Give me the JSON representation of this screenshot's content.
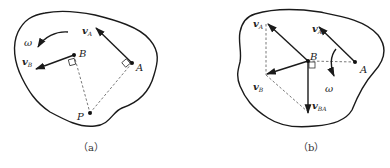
{
  "figure_a": {
    "caption": "（a）",
    "labels": {
      "vA": "v",
      "vA_sub": "A",
      "vB": "v",
      "vB_sub": "B",
      "B": "B",
      "A": "A",
      "P": "P",
      "omega": "ω"
    },
    "points": {
      "A": [
        132,
        63
      ],
      "B": [
        74,
        55
      ],
      "P": [
        90,
        113
      ]
    }
  },
  "figure_b": {
    "caption": "（b）",
    "labels": {
      "vA_left": "v",
      "vA_left_sub": "A",
      "vA_right": "v",
      "vA_right_sub": "A",
      "vB": "v",
      "vB_sub": "B",
      "vBA": "v",
      "vBA_sub": "BA",
      "B": "B",
      "A": "A",
      "omega": "ω"
    },
    "points": {
      "A": [
        355,
        62
      ],
      "B": [
        308,
        61
      ]
    }
  }
}
